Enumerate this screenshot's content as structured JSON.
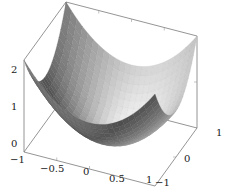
{
  "chart_data": {
    "type": "surface3d",
    "title": "",
    "function": "z = x^2 + y^2",
    "xlabel": "",
    "ylabel": "",
    "zlabel": "",
    "x_range": [
      -1,
      1
    ],
    "y_range": [
      -1,
      1
    ],
    "z_range": [
      0,
      2
    ],
    "x_ticks": [
      -1,
      -0.5,
      0,
      0.5,
      1
    ],
    "x_tick_labels": [
      "−1",
      "−0.5",
      "0",
      "0.5",
      "1"
    ],
    "y_ticks": [
      -1,
      0,
      1
    ],
    "y_tick_labels": [
      "−1",
      "0",
      "1"
    ],
    "z_ticks": [
      0,
      1,
      2
    ],
    "z_tick_labels": [
      "0",
      "1",
      "2"
    ],
    "grid": false,
    "legend": null,
    "colormap": "grayscale",
    "samples": 25,
    "sample_values": {
      "x": [
        -1,
        -0.5,
        0,
        0.5,
        1
      ],
      "y": [
        -1,
        -0.5,
        0,
        0.5,
        1
      ],
      "z": [
        [
          2.0,
          1.25,
          1.0,
          1.25,
          2.0
        ],
        [
          1.25,
          0.5,
          0.25,
          0.5,
          1.25
        ],
        [
          1.0,
          0.25,
          0.0,
          0.25,
          1.0
        ],
        [
          1.25,
          0.5,
          0.25,
          0.5,
          1.25
        ],
        [
          2.0,
          1.25,
          1.0,
          1.25,
          2.0
        ]
      ]
    }
  },
  "colors": {
    "axis_box": "#7a7a7a",
    "surface_dark": "#555555",
    "surface_light": "#e8e8e8",
    "text": "#222222"
  }
}
